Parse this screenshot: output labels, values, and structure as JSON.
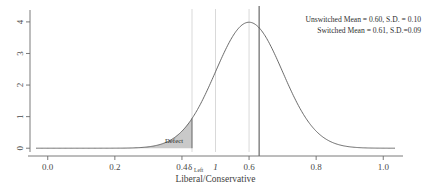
{
  "chart_data": {
    "type": "line",
    "title": "",
    "xlabel": "Liberal/Conservative",
    "ylabel": "",
    "xlim": [
      -0.035,
      1.035
    ],
    "ylim": [
      -0.12,
      4.25
    ],
    "grid": true,
    "xticks": [
      "0.0",
      "0.2",
      "0.4",
      "0.6",
      "0.8",
      "1.0"
    ],
    "xtick_values": [
      0.0,
      0.2,
      0.4,
      0.6,
      0.8,
      1.0
    ],
    "yticks": [
      "0",
      "1",
      "2",
      "3",
      "4"
    ],
    "ytick_values": [
      0,
      1,
      2,
      3,
      4
    ],
    "series": [
      {
        "name": "Normal density",
        "mean": 0.6,
        "sd": 0.1,
        "peak_y": 3.99
      }
    ],
    "shaded_region": {
      "label": "Defect",
      "from": 0.0,
      "to": 0.43
    },
    "vertical_lines": [
      {
        "name": "delta-left",
        "x": 0.43,
        "style": "grid"
      },
      {
        "name": "threshold-one",
        "x": 0.5,
        "style": "grid"
      },
      {
        "name": "tick-0.6",
        "x": 0.6,
        "style": "grid"
      },
      {
        "name": "mean-line",
        "x": 0.63,
        "style": "solid-dark"
      }
    ],
    "annotations": [
      "Unswitched Mean = 0.60, S.D. = 0.10",
      "Switched Mean = 0.61, S.D.=0.09"
    ]
  },
  "axis": {
    "x_title": "Liberal/Conservative",
    "delta_symbol": "δ",
    "delta_subscript": "Left",
    "one_marker": "1"
  },
  "labels": {
    "defect": "Defect",
    "annotation_unswitched": "Unswitched Mean = 0.60, S.D. = 0.10",
    "annotation_switched": "Switched Mean = 0.61, S.D.=0.09",
    "xtick_0": "0.0",
    "xtick_1": "0.2",
    "xtick_2": "0.4",
    "xtick_3": "0.6",
    "xtick_4": "0.8",
    "xtick_5": "1.0",
    "ytick_0": "0",
    "ytick_1": "1",
    "ytick_2": "2",
    "ytick_3": "3",
    "ytick_4": "4"
  },
  "colors": {
    "curve": "#5a5a5a",
    "shade": "#a8a8a8",
    "grid": "#c9c9c9",
    "axis": "#6b6b6b",
    "text": "#3a3a3a"
  }
}
